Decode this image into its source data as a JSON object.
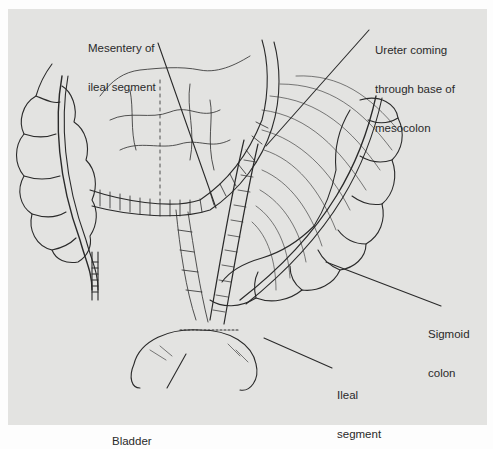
{
  "figure": {
    "background_color": "#e3e3e1",
    "line_color": "#2a2a2a",
    "labels": {
      "mesentery": {
        "line1": "Mesentery of",
        "line2": "ileal segment"
      },
      "ureter": {
        "line1": "Ureter coming",
        "line2": "through base of",
        "line3": "mesocolon"
      },
      "sigmoid": {
        "line1": "Sigmoid",
        "line2": "colon"
      },
      "ileal": {
        "line1": "Ileal",
        "line2": "segment"
      },
      "bladder": {
        "line1": "Bladder"
      }
    }
  }
}
